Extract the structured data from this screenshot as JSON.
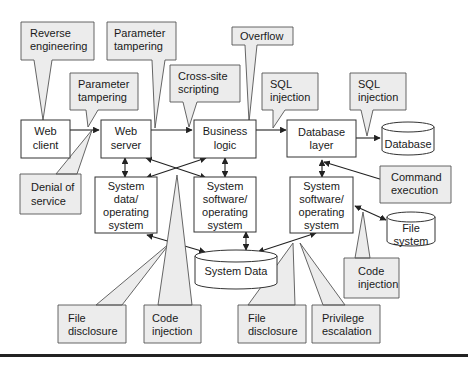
{
  "diagram": {
    "components": {
      "web_client": [
        "Web",
        "client"
      ],
      "web_server": [
        "Web",
        "server"
      ],
      "business_logic": [
        "Business",
        "logic"
      ],
      "database_layer": [
        "Database",
        "layer"
      ],
      "database": "Database",
      "sys_data_os": [
        "System",
        "data/",
        "operating",
        "system"
      ],
      "sys_sw_os_mid": [
        "System",
        "software/",
        "operating",
        "system"
      ],
      "sys_sw_os_right": [
        "System",
        "software/",
        "operating",
        "system"
      ],
      "system_data": "System Data",
      "file_system": [
        "File",
        "system"
      ]
    },
    "threats": {
      "reverse_engineering": [
        "Reverse",
        "engineering"
      ],
      "param_tampering_top": [
        "Parameter",
        "tampering"
      ],
      "param_tampering_mid": [
        "Parameter",
        "tampering"
      ],
      "cross_site_scripting": [
        "Cross-site",
        "scripting"
      ],
      "overflow": [
        "Overflow"
      ],
      "sql_injection_1": [
        "SQL",
        "injection"
      ],
      "sql_injection_2": [
        "SQL",
        "injection"
      ],
      "denial_of_service": [
        "Denial of",
        "service"
      ],
      "command_execution": [
        "Command",
        "execution"
      ],
      "code_injection_right": [
        "Code",
        "injection"
      ],
      "file_disclosure_left": [
        "File",
        "disclosure"
      ],
      "code_injection_left": [
        "Code",
        "injection"
      ],
      "file_disclosure_right": [
        "File",
        "disclosure"
      ],
      "privilege_escalation": [
        "Privilege",
        "escalation"
      ]
    },
    "colors": {
      "callout_fill": "#ececec",
      "box_fill": "#ffffff",
      "stroke": "#333333"
    }
  }
}
